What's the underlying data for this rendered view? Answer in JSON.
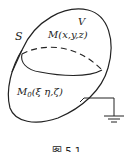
{
  "figure": {
    "labels": {
      "surface": "S",
      "volume": "V",
      "point_m": "M(x,y,z)",
      "point_m0": "M",
      "point_m0_sub": "0",
      "point_m0_args": "(ξ η,ζ)"
    },
    "caption": "图 5.1",
    "ground_symbol": "ground-icon",
    "colors": {
      "stroke": "#222222",
      "background": "#ffffff"
    }
  }
}
